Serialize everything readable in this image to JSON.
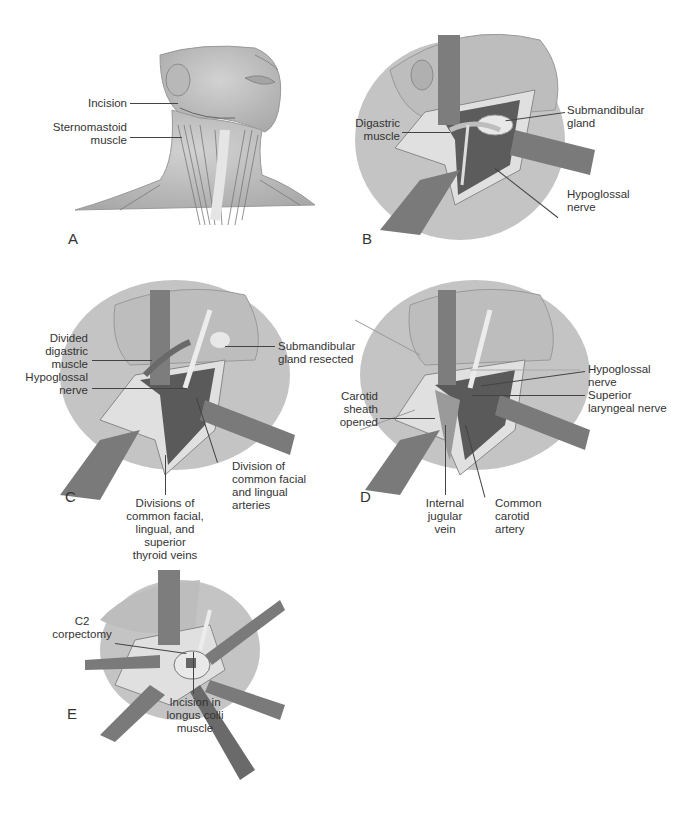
{
  "figure": {
    "panels": [
      {
        "id": "A",
        "letter": "A",
        "labels": {
          "incision": "Incision",
          "sternomastoid": "Sternomastoid\nmuscle"
        }
      },
      {
        "id": "B",
        "letter": "B",
        "labels": {
          "digastric": "Digastric\nmuscle",
          "submandibular": "Submandibular\ngland",
          "hypoglossal": "Hypoglossal\nnerve"
        }
      },
      {
        "id": "C",
        "letter": "C",
        "labels": {
          "divided_digastric": "Divided\ndigastric\nmuscle",
          "hypoglossal": "Hypoglossal\nnerve",
          "submandibular_resected": "Submandibular\ngland resected",
          "division_arteries": "Division of\ncommon facial\nand lingual\narteries",
          "divisions_veins": "Divisions of\ncommon facial,\nlingual, and\nsuperior\nthyroid veins"
        }
      },
      {
        "id": "D",
        "letter": "D",
        "labels": {
          "carotid_sheath": "Carotid\nsheath\nopened",
          "hypoglossal": "Hypoglossal\nnerve",
          "superior_laryngeal": "Superior\nlaryngeal nerve",
          "internal_jugular": "Internal\njugular\nvein",
          "common_carotid": "Common\ncarotid\nartery"
        }
      },
      {
        "id": "E",
        "letter": "E",
        "labels": {
          "c2_corpectomy": "C2\ncorpectomy",
          "longus_colli": "Incision in\nlongus colli\nmuscle"
        }
      }
    ],
    "colors": {
      "skin": "#c9c9c9",
      "skin_shadow": "#a9a9a9",
      "muscle": "#8a8a8a",
      "retractor": "#7d7d7d",
      "vessel": "#4a4a4a",
      "fat": "#e2e2e2",
      "background": "#ffffff"
    }
  }
}
